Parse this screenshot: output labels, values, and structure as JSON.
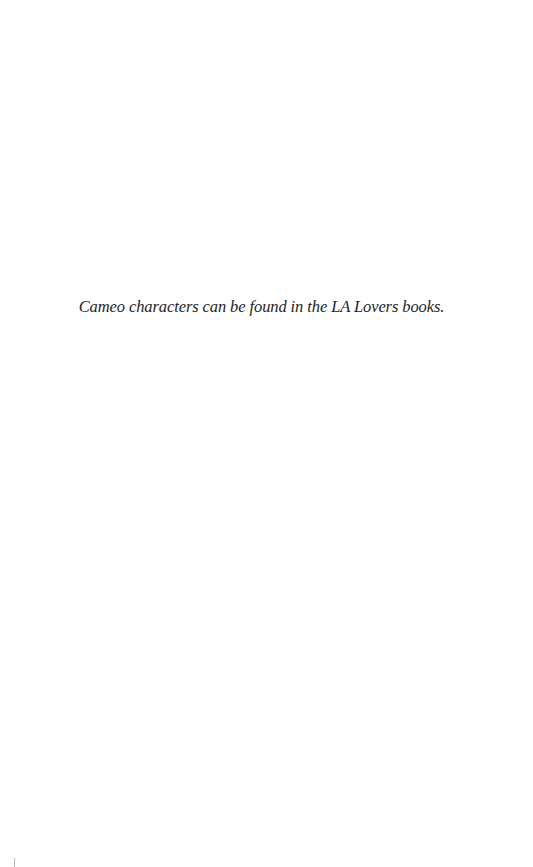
{
  "page": {
    "background": "#ffffff",
    "text_color": "#1e1e1e",
    "note": "Cameo characters can be found in the LA Lovers books."
  }
}
